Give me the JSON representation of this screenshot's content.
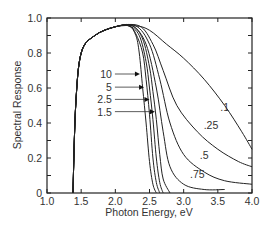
{
  "chart_data": {
    "type": "line",
    "title": "",
    "xlabel": "Photon Energy, eV",
    "ylabel": "Spectral Response",
    "xlim": [
      1.0,
      4.0
    ],
    "ylim": [
      0,
      1.0
    ],
    "x_ticks": [
      "1.0",
      "1.5",
      "2.0",
      "2.5",
      "3.0",
      "3.5",
      "4.0"
    ],
    "y_ticks": [
      "0",
      "0.2",
      "0.4",
      "0.6",
      "0.8",
      "1.0"
    ],
    "grid": false,
    "series": [
      {
        "name": "10",
        "x": [
          1.38,
          1.42,
          1.5,
          1.7,
          2.0,
          2.2,
          2.3,
          2.35,
          2.4,
          2.45,
          2.5,
          2.55,
          2.6
        ],
        "y": [
          0,
          0.5,
          0.8,
          0.9,
          0.95,
          0.955,
          0.9,
          0.8,
          0.6,
          0.4,
          0.18,
          0.05,
          0
        ]
      },
      {
        "name": "5",
        "x": [
          1.38,
          1.42,
          1.5,
          1.7,
          2.0,
          2.2,
          2.3,
          2.4,
          2.45,
          2.5,
          2.55,
          2.6,
          2.65
        ],
        "y": [
          0,
          0.5,
          0.8,
          0.9,
          0.95,
          0.955,
          0.91,
          0.8,
          0.65,
          0.45,
          0.2,
          0.06,
          0
        ]
      },
      {
        "name": "2.5",
        "x": [
          1.38,
          1.42,
          1.5,
          1.7,
          2.0,
          2.2,
          2.35,
          2.45,
          2.5,
          2.55,
          2.6,
          2.65,
          2.7
        ],
        "y": [
          0,
          0.5,
          0.8,
          0.9,
          0.95,
          0.955,
          0.9,
          0.75,
          0.6,
          0.42,
          0.2,
          0.06,
          0
        ]
      },
      {
        "name": "1.5",
        "x": [
          1.38,
          1.42,
          1.5,
          1.7,
          2.0,
          2.25,
          2.4,
          2.5,
          2.55,
          2.6,
          2.65,
          2.7,
          2.8
        ],
        "y": [
          0,
          0.5,
          0.8,
          0.9,
          0.95,
          0.955,
          0.88,
          0.72,
          0.58,
          0.42,
          0.22,
          0.08,
          0
        ]
      },
      {
        "name": ".75",
        "x": [
          1.38,
          1.42,
          1.5,
          1.7,
          2.0,
          2.25,
          2.45,
          2.6,
          2.7,
          2.8,
          3.0,
          3.3,
          3.6
        ],
        "y": [
          0,
          0.5,
          0.8,
          0.9,
          0.95,
          0.955,
          0.85,
          0.6,
          0.35,
          0.15,
          0.05,
          0.02,
          0.02
        ]
      },
      {
        "name": ".5",
        "x": [
          1.38,
          1.42,
          1.5,
          1.7,
          2.0,
          2.3,
          2.5,
          2.65,
          2.8,
          3.0,
          3.3,
          3.6,
          4.0
        ],
        "y": [
          0,
          0.5,
          0.8,
          0.9,
          0.95,
          0.955,
          0.85,
          0.65,
          0.4,
          0.22,
          0.12,
          0.07,
          0.05
        ]
      },
      {
        "name": ".25",
        "x": [
          1.38,
          1.42,
          1.5,
          1.7,
          2.0,
          2.35,
          2.55,
          2.7,
          2.9,
          3.2,
          3.5,
          3.8,
          4.0
        ],
        "y": [
          0,
          0.5,
          0.8,
          0.9,
          0.95,
          0.955,
          0.85,
          0.7,
          0.5,
          0.35,
          0.25,
          0.18,
          0.15
        ]
      },
      {
        "name": ".1",
        "x": [
          1.38,
          1.42,
          1.5,
          1.7,
          2.0,
          2.3,
          2.5,
          2.75,
          3.0,
          3.3,
          3.6,
          3.85,
          4.0
        ],
        "y": [
          0,
          0.5,
          0.8,
          0.9,
          0.95,
          0.955,
          0.93,
          0.85,
          0.77,
          0.65,
          0.5,
          0.35,
          0.25
        ]
      }
    ],
    "annotations": [
      {
        "text": "10",
        "arrow": true,
        "x": 1.95,
        "y": 0.68
      },
      {
        "text": "5",
        "arrow": true,
        "x": 1.95,
        "y": 0.605
      },
      {
        "text": "2.5",
        "arrow": true,
        "x": 1.95,
        "y": 0.535
      },
      {
        "text": "1.5",
        "arrow": true,
        "x": 1.95,
        "y": 0.465
      },
      {
        "text": ".1",
        "arrow": false,
        "x": 3.6,
        "y": 0.49
      },
      {
        "text": ".25",
        "arrow": false,
        "x": 3.4,
        "y": 0.39
      },
      {
        "text": ".5",
        "arrow": false,
        "x": 3.3,
        "y": 0.22
      },
      {
        "text": ".75",
        "arrow": false,
        "x": 3.2,
        "y": 0.11
      }
    ]
  }
}
